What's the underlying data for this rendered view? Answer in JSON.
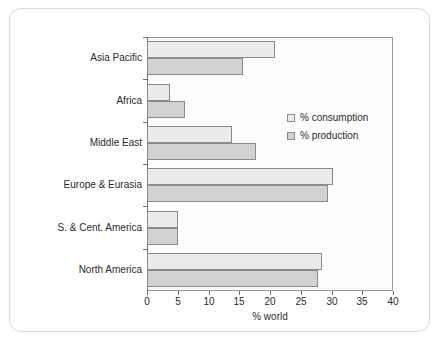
{
  "chart_data": {
    "type": "bar",
    "orientation": "horizontal",
    "title": "",
    "xlabel": "% world",
    "ylabel": "",
    "xlim": [
      0,
      40
    ],
    "xticks": [
      0,
      5,
      10,
      15,
      20,
      25,
      30,
      35,
      40
    ],
    "grid": false,
    "legend_position": "inside-right-upper",
    "categories": [
      "North America",
      "S. & Cent. America",
      "Europe & Eurasia",
      "Middle East",
      "Africa",
      "Asia Pacific"
    ],
    "series": [
      {
        "name": "% consumption",
        "color": "#ebebeb",
        "values": [
          28.5,
          5.0,
          30.2,
          13.8,
          3.7,
          20.8
        ]
      },
      {
        "name": "% production",
        "color": "#d2d2d2",
        "values": [
          27.8,
          5.0,
          29.4,
          17.7,
          6.2,
          15.6
        ]
      }
    ]
  },
  "legend": {
    "entries": [
      {
        "label": "% consumption",
        "swatch": "#ebebeb"
      },
      {
        "label": "% production",
        "swatch": "#d2d2d2"
      }
    ]
  },
  "axis": {
    "x_title": "% world",
    "tick_labels": [
      "0",
      "5",
      "10",
      "15",
      "20",
      "25",
      "30",
      "35",
      "40"
    ]
  },
  "colors": {
    "frame_border": "#d8d8d8",
    "plot_border": "#9a9a9a",
    "axis_line": "#6e6e6e",
    "bar_border": "#8a8a8a",
    "text": "#2b2b2b",
    "plot_background": "#fdfdfd"
  }
}
